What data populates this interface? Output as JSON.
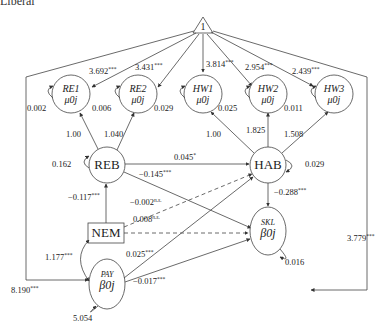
{
  "header": {
    "cut_text": "Liberal"
  },
  "constant_node": {
    "label": "1"
  },
  "nodes": {
    "re1": {
      "name": "RE1",
      "sub": "μ0j"
    },
    "re2": {
      "name": "RE2",
      "sub": "μ0j"
    },
    "hw1": {
      "name": "HW1",
      "sub": "μ0j"
    },
    "hw2": {
      "name": "HW2",
      "sub": "μ0j"
    },
    "hw3": {
      "name": "HW3",
      "sub": "μ0j"
    },
    "reb": {
      "name": "REB"
    },
    "hab": {
      "name": "HAB"
    },
    "nem": {
      "name": "NEM"
    },
    "skl": {
      "name": "SKL",
      "sub": "β0j"
    },
    "pay": {
      "name": "PAY",
      "sub": "β0j"
    }
  },
  "intercepts": {
    "re1": {
      "value": "3.692",
      "sig": "***"
    },
    "re2": {
      "value": "3.431",
      "sig": "***"
    },
    "hw1": {
      "value": "3.814",
      "sig": "***"
    },
    "hw2": {
      "value": "2.954",
      "sig": "***"
    },
    "hw3": {
      "value": "2.439",
      "sig": "***"
    },
    "pay": {
      "value": "8.190",
      "sig": "***"
    },
    "skl": {
      "value": "3.779",
      "sig": "***"
    }
  },
  "residuals": {
    "re1": "0.002",
    "re2": "0.006",
    "hw1": "0.029",
    "hw2": "0.025",
    "hw3": "0.011",
    "reb": "0.162",
    "hab": "0.029",
    "skl": "0.016",
    "pay": "5.054"
  },
  "loadings": {
    "reb_re1": "1.00",
    "reb_re2": "1.040",
    "hab_hw1": "1.00",
    "hab_hw2": "1.825",
    "hab_hw3": "1.508"
  },
  "paths": {
    "reb_hab": {
      "value": "0.045",
      "sig": "*"
    },
    "reb_skl": {
      "value": "−0.145",
      "sig": "***"
    },
    "hab_skl": {
      "value": "−0.288",
      "sig": "***"
    },
    "nem_reb": {
      "value": "−0.117",
      "sig": "***"
    },
    "nem_hab": {
      "value": "−0.002",
      "sig": "n.s."
    },
    "nem_skl": {
      "value": "0.008",
      "sig": "n.s."
    },
    "pay_nem": {
      "value": "1.177",
      "sig": "***"
    },
    "pay_hab": {
      "value": "0.025",
      "sig": "***"
    },
    "pay_skl": {
      "value": "−0.017",
      "sig": "***"
    }
  }
}
